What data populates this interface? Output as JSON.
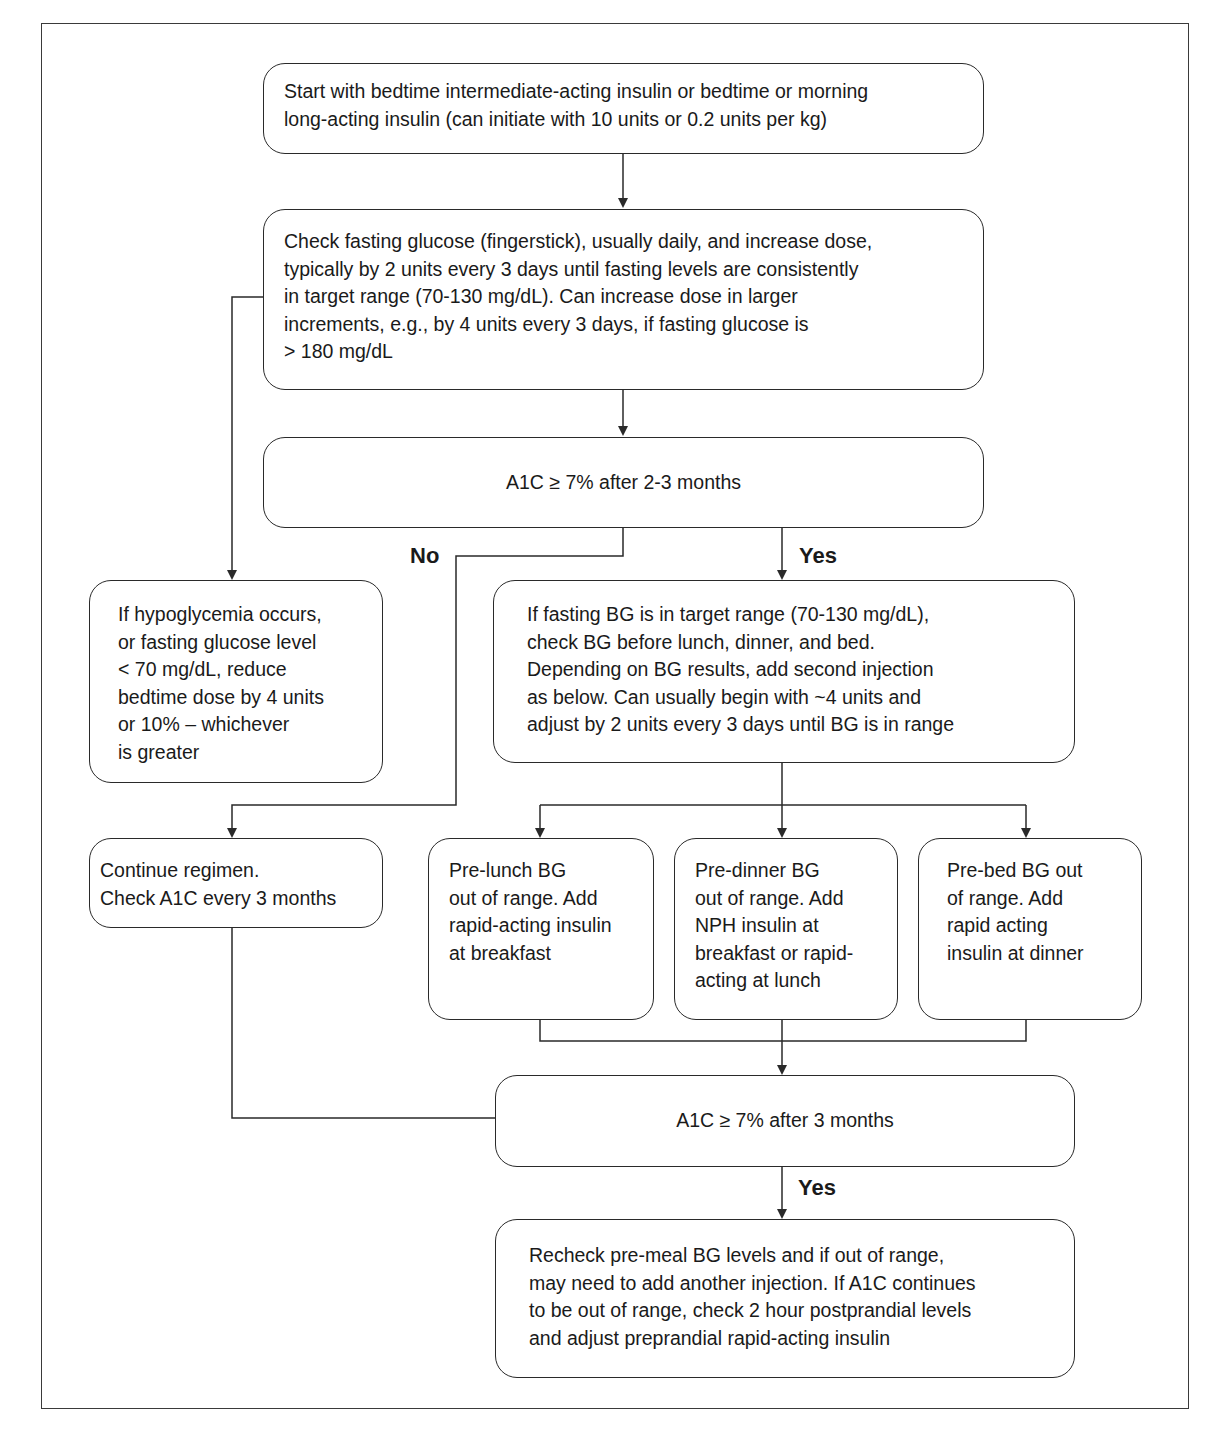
{
  "flowchart": {
    "nodes": {
      "start": {
        "lines": [
          "Start with bedtime intermediate-acting insulin or bedtime or morning",
          "long-acting insulin (can initiate with 10 units or 0.2 units per kg)"
        ]
      },
      "check_fasting": {
        "lines": [
          "Check fasting glucose (fingerstick), usually daily, and increase dose,",
          "typically by 2 units every 3 days until fasting levels are consistently",
          "in target range (70-130 mg/dL). Can increase dose in larger",
          "increments, e.g., by 4 units every 3 days, if fasting glucose is",
          "> 180 mg/dL"
        ]
      },
      "a1c_decision_1": {
        "text": "A1C ≥ 7% after 2-3 months"
      },
      "hypoglycemia": {
        "lines": [
          "If hypoglycemia occurs,",
          "or fasting glucose level",
          "< 70 mg/dL, reduce",
          "bedtime dose by 4 units",
          "or 10% – whichever",
          "is greater"
        ]
      },
      "fasting_in_range": {
        "lines": [
          "If fasting BG is in target range (70-130 mg/dL),",
          "check BG before lunch, dinner, and bed.",
          "Depending on BG results, add second injection",
          "as below. Can usually begin with ~4 units and",
          "adjust by 2 units every 3 days until BG is in range"
        ]
      },
      "continue_regimen": {
        "lines": [
          "Continue regimen.",
          "Check A1C every 3 months"
        ]
      },
      "pre_lunch": {
        "lines": [
          "Pre-lunch BG",
          "out of range. Add",
          "rapid-acting insulin",
          "at breakfast"
        ]
      },
      "pre_dinner": {
        "lines": [
          "Pre-dinner BG",
          "out of range. Add",
          "NPH insulin at",
          "breakfast or rapid-",
          "acting at lunch"
        ]
      },
      "pre_bed": {
        "lines": [
          "Pre-bed BG out",
          "of range. Add",
          "rapid acting",
          "insulin at dinner"
        ]
      },
      "a1c_decision_2": {
        "text": "A1C ≥ 7% after 3 months"
      },
      "recheck": {
        "lines": [
          "Recheck pre-meal BG levels and if out of range,",
          "may need to add another injection. If A1C continues",
          "to be out of range, check 2 hour postprandial levels",
          "and adjust preprandial rapid-acting insulin"
        ]
      }
    },
    "edge_labels": {
      "no_1": "No",
      "yes_1": "Yes",
      "yes_2": "Yes"
    },
    "edges": [
      {
        "from": "start",
        "to": "check_fasting"
      },
      {
        "from": "check_fasting",
        "to": "a1c_decision_1"
      },
      {
        "from": "check_fasting",
        "to": "hypoglycemia"
      },
      {
        "from": "a1c_decision_1",
        "to": "continue_regimen",
        "label": "No"
      },
      {
        "from": "a1c_decision_1",
        "to": "fasting_in_range",
        "label": "Yes"
      },
      {
        "from": "fasting_in_range",
        "to": "pre_lunch"
      },
      {
        "from": "fasting_in_range",
        "to": "pre_dinner"
      },
      {
        "from": "fasting_in_range",
        "to": "pre_bed"
      },
      {
        "from": "pre_lunch",
        "to": "a1c_decision_2"
      },
      {
        "from": "pre_dinner",
        "to": "a1c_decision_2"
      },
      {
        "from": "pre_bed",
        "to": "a1c_decision_2"
      },
      {
        "from": "continue_regimen",
        "to": "a1c_decision_2"
      },
      {
        "from": "a1c_decision_2",
        "to": "recheck",
        "label": "Yes"
      }
    ]
  }
}
